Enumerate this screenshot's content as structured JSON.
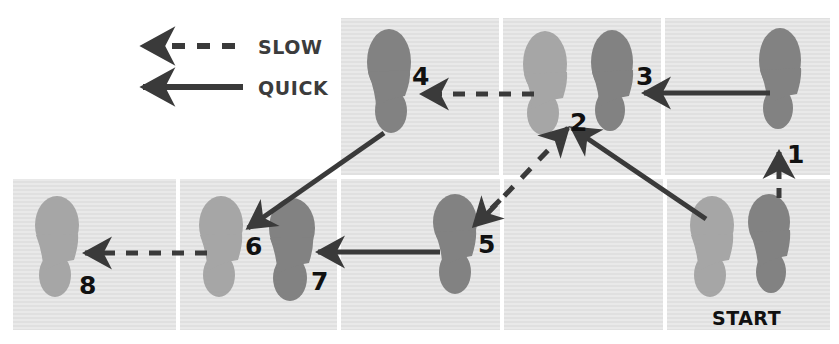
{
  "diagram": {
    "colors": {
      "background": "#ffffff",
      "panel": "#e6e6e6",
      "panel_stripe": "#dcdcdc",
      "footprint_dark": "#828282",
      "footprint_light": "#a6a6a6",
      "arrow": "#3a3a3a",
      "label_text": "#111111"
    },
    "legend": {
      "items": [
        {
          "id": "slow",
          "label": "SLOW",
          "line_style": "dashed",
          "arrow_direction": "left"
        },
        {
          "id": "quick",
          "label": "QUICK",
          "line_style": "solid",
          "arrow_direction": "left"
        }
      ]
    },
    "grid": {
      "rows": 2,
      "top_row_panels": 3,
      "bottom_row_panels": 4
    },
    "start_label": "START",
    "footsteps": [
      {
        "number": "1",
        "shade": "dark",
        "foot": "right",
        "panel": "top-right"
      },
      {
        "number": "2",
        "shade": "light",
        "foot": "left",
        "panel": "top-middle"
      },
      {
        "number": "3",
        "shade": "dark",
        "foot": "right",
        "panel": "top-middle"
      },
      {
        "number": "4",
        "shade": "dark",
        "foot": "right",
        "panel": "top-left"
      },
      {
        "number": "5",
        "shade": "dark",
        "foot": "right",
        "panel": "bottom-3"
      },
      {
        "number": "6",
        "shade": "light",
        "foot": "left",
        "panel": "bottom-2"
      },
      {
        "number": "7",
        "shade": "dark",
        "foot": "right",
        "panel": "bottom-2"
      },
      {
        "number": "8",
        "shade": "light",
        "foot": "left",
        "panel": "bottom-1"
      },
      {
        "number": "",
        "shade": "light",
        "foot": "left",
        "panel": "bottom-4"
      },
      {
        "number": "",
        "shade": "dark",
        "foot": "right",
        "panel": "bottom-4"
      }
    ],
    "movements": [
      {
        "from": "START",
        "to": "1",
        "timing": "SLOW",
        "style": "dashed",
        "direction": "up"
      },
      {
        "from": "1",
        "to": "2",
        "timing": "QUICK",
        "style": "solid",
        "direction": "down-left"
      },
      {
        "from": "2",
        "to": "3",
        "timing": "QUICK",
        "style": "solid",
        "direction": "left"
      },
      {
        "from": "3",
        "to": "4",
        "timing": "SLOW",
        "style": "dashed",
        "direction": "left"
      },
      {
        "from": "4",
        "to": "6",
        "timing": "QUICK",
        "style": "solid",
        "direction": "down-left"
      },
      {
        "from": "5",
        "to": "2",
        "timing": "SLOW",
        "style": "dashed",
        "direction": "up-right"
      },
      {
        "from": "6",
        "to": "7",
        "timing": "QUICK",
        "style": "solid",
        "direction": "left"
      },
      {
        "from": "7",
        "to": "8",
        "timing": "SLOW",
        "style": "dashed",
        "direction": "left"
      }
    ]
  }
}
